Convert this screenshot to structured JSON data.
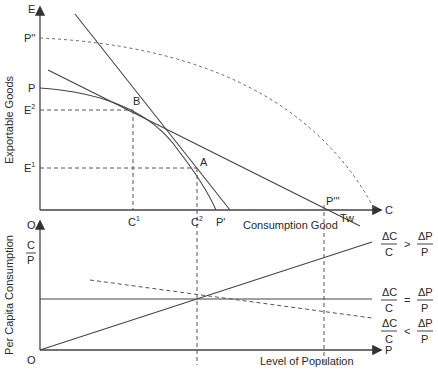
{
  "diagram": {
    "top_panel": {
      "y_axis_label": "Exportable Goods",
      "y_axis_end": "E",
      "x_axis_end": "C",
      "x_axis_label": "Consumption Good",
      "y_ticks": [
        {
          "label": "P''",
          "sup": ""
        },
        {
          "label": "P",
          "sup": ""
        },
        {
          "label": "E",
          "sup": "2"
        },
        {
          "label": "E",
          "sup": "1"
        }
      ],
      "x_ticks": [
        {
          "label": "C",
          "sup": "1"
        },
        {
          "label": "C",
          "sup": "2"
        },
        {
          "label": "P'",
          "sup": ""
        },
        {
          "label": "P'''",
          "sup": ""
        },
        {
          "label": "Tw",
          "sup": ""
        }
      ],
      "points": {
        "B": "B",
        "A": "A"
      }
    },
    "bottom_panel": {
      "y_axis_label": "Per Capita Consumption",
      "y_axis_top": "O",
      "y_axis_symbol_num": "C",
      "y_axis_symbol_den": "P",
      "origin": "O",
      "x_axis_end": "P",
      "x_axis_label": "Level of Population",
      "conditions": [
        {
          "lhs_num": "ΔC",
          "lhs_den": "C",
          "op": ">",
          "rhs_num": "ΔP",
          "rhs_den": "P"
        },
        {
          "lhs_num": "ΔC",
          "lhs_den": "C",
          "op": "=",
          "rhs_num": "ΔP",
          "rhs_den": "P"
        },
        {
          "lhs_num": "ΔC",
          "lhs_den": "C",
          "op": "<",
          "rhs_num": "ΔP",
          "rhs_den": "P"
        }
      ]
    }
  }
}
